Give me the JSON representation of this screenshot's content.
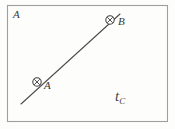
{
  "figure": {
    "background_color": "#fdfdfc",
    "ink_color": "#4a4a4a",
    "border_color": "#9a9a9a"
  },
  "region": {
    "name": "boundary-rectangle",
    "label": "A",
    "x": 7,
    "y": 5,
    "width": 161,
    "height": 117
  },
  "line": {
    "name": "line-through-a-b",
    "x1": 21,
    "y1": 104,
    "x2": 120,
    "y2": 14,
    "color": "#4a4a4a",
    "width": 1
  },
  "points": [
    {
      "id": "point-a",
      "label": "A",
      "marker": "circled-cross",
      "cx": 37,
      "cy": 82,
      "r": 4.2,
      "label_x": 44,
      "label_y": 80
    },
    {
      "id": "point-b",
      "label": "B",
      "marker": "circled-cross",
      "cx": 110,
      "cy": 20,
      "r": 4.2,
      "label_x": 118,
      "label_y": 16
    }
  ],
  "annotation": {
    "id": "symbol-t-c",
    "base": "t",
    "subscript": "C",
    "x": 115,
    "y": 89
  }
}
